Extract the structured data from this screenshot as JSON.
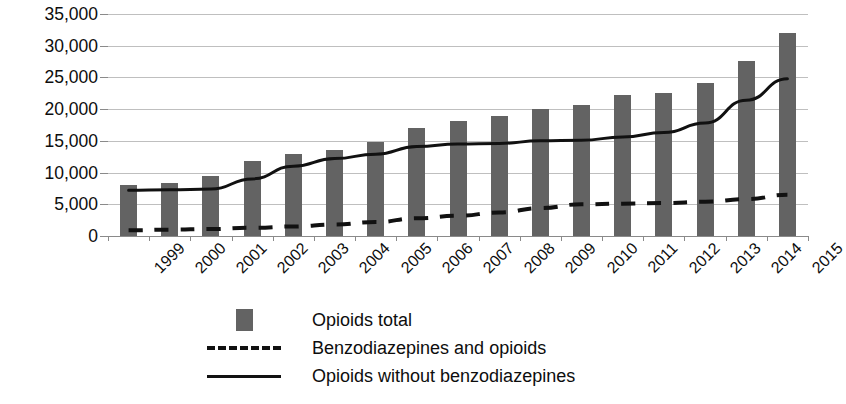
{
  "chart_data": {
    "type": "bar",
    "title": "",
    "subtitle": "",
    "xlabel": "",
    "ylabel": "",
    "ylim": [
      0,
      35000
    ],
    "ytick_values": [
      0,
      5000,
      10000,
      15000,
      20000,
      25000,
      30000,
      35000
    ],
    "ytick_labels": [
      "0",
      "5,000",
      "10,000",
      "15,000",
      "20,000",
      "25,000",
      "30,000",
      "35,000"
    ],
    "grid": true,
    "legend_position": "bottom",
    "categories": [
      "1999",
      "2000",
      "2001",
      "2002",
      "2003",
      "2004",
      "2005",
      "2006",
      "2007",
      "2008",
      "2009",
      "2010",
      "2011",
      "2012",
      "2013",
      "2014",
      "2015"
    ],
    "series": [
      {
        "name": "Opioids total",
        "render": "bar",
        "color": "#636363",
        "values": [
          8000,
          8300,
          9500,
          11900,
          12900,
          13500,
          14900,
          17100,
          18200,
          18900,
          20000,
          20600,
          22200,
          22600,
          24100,
          27600,
          32000
        ]
      },
      {
        "name": "Benzodiazepines and opioids",
        "render": "dashed-line",
        "color": "#111111",
        "values": [
          900,
          1000,
          1100,
          1300,
          1500,
          1800,
          2200,
          2800,
          3200,
          3700,
          4400,
          5000,
          5100,
          5200,
          5400,
          5800,
          6500
        ]
      },
      {
        "name": "Opioids without benzodiazepines",
        "render": "solid-line",
        "color": "#111111",
        "values": [
          7200,
          7300,
          7400,
          9000,
          11000,
          12200,
          12900,
          14100,
          14500,
          14600,
          15000,
          15100,
          15600,
          16300,
          17800,
          21400,
          24800
        ]
      }
    ]
  },
  "legend": {
    "items": [
      {
        "label": "Opioids total",
        "key": "bar-swatch"
      },
      {
        "label": "Benzodiazepines and opioids",
        "key": "dashed-line-key"
      },
      {
        "label": "Opioids without benzodiazepines",
        "key": "solid-line-key"
      }
    ]
  }
}
